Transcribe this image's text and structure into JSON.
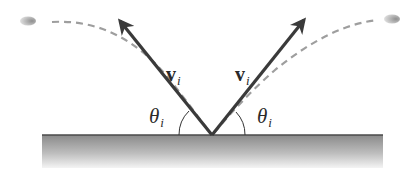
{
  "diagram": {
    "colors": {
      "background": "#ffffff",
      "arrow": "#3a3a3a",
      "trajectory": "#9a9a9a",
      "surface_top": "#555555",
      "surface_fill_start": "#8c8c8c",
      "surface_fill_end": "#f2f2f2",
      "ball": "#a8a8a8",
      "arc": "#333333"
    },
    "surface": {
      "x1": 42,
      "x2": 383,
      "y_top": 135,
      "y_bottom": 168
    },
    "vertex": {
      "x": 212,
      "y": 135
    },
    "left": {
      "velocity_label": {
        "symbol": "v",
        "subscript": "i"
      },
      "angle_label": {
        "symbol": "θ",
        "subscript": "i"
      },
      "arrow_tip": {
        "x": 118,
        "y": 19
      },
      "ball": {
        "x": 27,
        "y": 20
      }
    },
    "right": {
      "velocity_label": {
        "symbol": "v",
        "subscript": "i"
      },
      "angle_label": {
        "symbol": "θ",
        "subscript": "i"
      },
      "arrow_tip": {
        "x": 306,
        "y": 18
      },
      "ball": {
        "x": 392,
        "y": 18
      }
    }
  }
}
